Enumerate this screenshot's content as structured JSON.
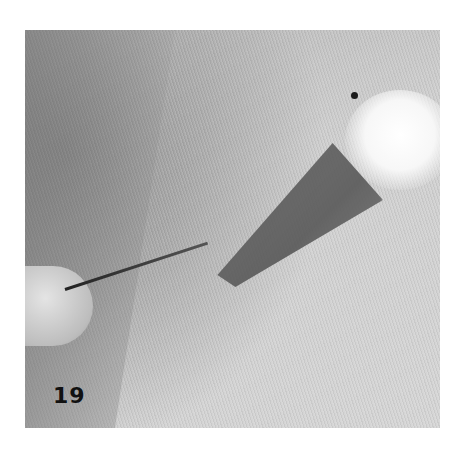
{
  "figure": {
    "step_number": "19",
    "colors": {
      "background": "#ffffff",
      "fabric": "#cccccc",
      "beak": "#5e5e5e",
      "head": "#f8f8f8",
      "eye": "#1a1a1a",
      "label": "#111111"
    }
  }
}
